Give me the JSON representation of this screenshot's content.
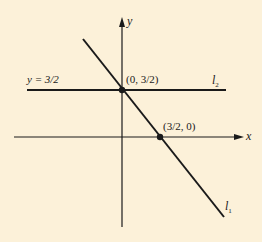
{
  "figure": {
    "background": "#fcf1d9",
    "ink": "#1a1a1a",
    "axes": {
      "x_label": "x",
      "y_label": "y"
    },
    "lines": [
      {
        "name": "l",
        "sub": "1",
        "description": "line through (0, 3/2) and (3/2, 0)"
      },
      {
        "name": "l",
        "sub": "2",
        "description": "horizontal line",
        "equation": "y = 3/2"
      }
    ],
    "points": [
      {
        "label": "(0, 3/2)"
      },
      {
        "label": "(3/2, 0)"
      }
    ]
  }
}
